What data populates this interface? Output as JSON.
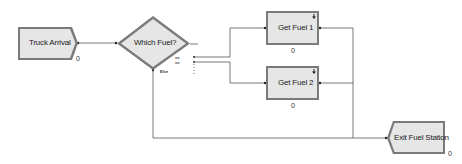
{
  "diagram": {
    "type": "flowchart",
    "modules": {
      "create": {
        "label": "Truck Arrival",
        "counter": "0"
      },
      "decide": {
        "label": "Which Fuel?",
        "else_label": "Else",
        "true_marks": [
          "==",
          "=="
        ]
      },
      "process1": {
        "label": "Get Fuel 1",
        "counter": "0"
      },
      "process2": {
        "label": "Get Fuel 2",
        "counter": "0"
      },
      "dispose": {
        "label": "Exit Fuel Station",
        "counter": "0"
      }
    },
    "connections": [
      {
        "from": "Truck Arrival",
        "to": "Which Fuel?"
      },
      {
        "from": "Which Fuel?",
        "to": "Get Fuel 1"
      },
      {
        "from": "Which Fuel?",
        "to": "Get Fuel 2"
      },
      {
        "from": "Which Fuel?",
        "to": "Exit Fuel Station",
        "label": "Else"
      },
      {
        "from": "Get Fuel 1",
        "to": "Exit Fuel Station"
      },
      {
        "from": "Get Fuel 2",
        "to": "Exit Fuel Station"
      }
    ],
    "colors": {
      "module_fill": "#e6e6e6",
      "module_border": "#7a7a7a",
      "line": "#555555"
    }
  }
}
